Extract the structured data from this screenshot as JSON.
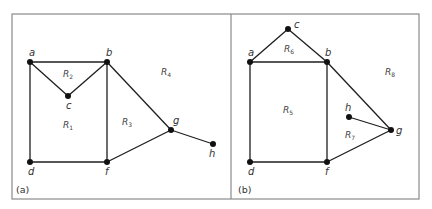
{
  "figure": {
    "frame": {
      "x": 12,
      "y": 14,
      "width": 407,
      "height": 185,
      "divider_x": 231,
      "color": "#8a8a8a"
    },
    "edge_color": "#1e1e1e",
    "panels": [
      {
        "label": "(a)",
        "label_pos": [
          16,
          193
        ],
        "vertices": [
          {
            "id": "a",
            "x": 30,
            "y": 62,
            "lx": 29,
            "ly": 56
          },
          {
            "id": "b",
            "x": 107,
            "y": 62,
            "lx": 106,
            "ly": 56
          },
          {
            "id": "c",
            "x": 68,
            "y": 96,
            "lx": 66,
            "ly": 109
          },
          {
            "id": "d",
            "x": 30,
            "y": 162,
            "lx": 28,
            "ly": 175
          },
          {
            "id": "f",
            "x": 107,
            "y": 162,
            "lx": 105,
            "ly": 175
          },
          {
            "id": "g",
            "x": 171,
            "y": 130,
            "lx": 173,
            "ly": 124
          },
          {
            "id": "h",
            "x": 213,
            "y": 144,
            "lx": 209,
            "ly": 157
          }
        ],
        "edges": [
          [
            "a",
            "b"
          ],
          [
            "a",
            "c"
          ],
          [
            "c",
            "b"
          ],
          [
            "a",
            "d"
          ],
          [
            "d",
            "f"
          ],
          [
            "b",
            "f"
          ],
          [
            "b",
            "g"
          ],
          [
            "f",
            "g"
          ],
          [
            "g",
            "h"
          ]
        ],
        "regions": [
          {
            "name": "R",
            "sub": "1",
            "x": 63,
            "y": 128
          },
          {
            "name": "R",
            "sub": "2",
            "x": 63,
            "y": 77
          },
          {
            "name": "R",
            "sub": "3",
            "x": 122,
            "y": 125
          },
          {
            "name": "R",
            "sub": "4",
            "x": 161,
            "y": 75
          }
        ]
      },
      {
        "label": "(b)",
        "label_pos": [
          238,
          193
        ],
        "vertices": [
          {
            "id": "a",
            "x": 250,
            "y": 62,
            "lx": 248,
            "ly": 56
          },
          {
            "id": "b",
            "x": 327,
            "y": 62,
            "lx": 325,
            "ly": 56
          },
          {
            "id": "c",
            "x": 288,
            "y": 29,
            "lx": 294,
            "ly": 28
          },
          {
            "id": "d",
            "x": 250,
            "y": 162,
            "lx": 248,
            "ly": 175
          },
          {
            "id": "f",
            "x": 327,
            "y": 162,
            "lx": 325,
            "ly": 175
          },
          {
            "id": "g",
            "x": 391,
            "y": 130,
            "lx": 396,
            "ly": 134
          },
          {
            "id": "h",
            "x": 349,
            "y": 117,
            "lx": 345,
            "ly": 111
          }
        ],
        "edges": [
          [
            "a",
            "c"
          ],
          [
            "c",
            "b"
          ],
          [
            "a",
            "b"
          ],
          [
            "a",
            "d"
          ],
          [
            "d",
            "f"
          ],
          [
            "b",
            "f"
          ],
          [
            "b",
            "g"
          ],
          [
            "f",
            "g"
          ],
          [
            "h",
            "g"
          ]
        ],
        "regions": [
          {
            "name": "R",
            "sub": "5",
            "x": 283,
            "y": 113
          },
          {
            "name": "R",
            "sub": "6",
            "x": 284,
            "y": 52
          },
          {
            "name": "R",
            "sub": "7",
            "x": 345,
            "y": 138
          },
          {
            "name": "R",
            "sub": "8",
            "x": 385,
            "y": 75
          }
        ]
      }
    ]
  }
}
